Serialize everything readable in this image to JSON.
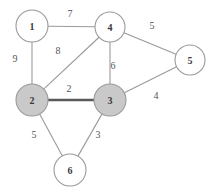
{
  "diagram": {
    "background_color": "#ffffff",
    "edge_color": "#9a9a9a",
    "highlight_edge_color": "#5a5a5a",
    "node_stroke_color": "#9a9a9a",
    "node_fill_default": "#ffffff",
    "node_fill_selected": "#c9c9c9"
  },
  "nodes": [
    {
      "id": "1",
      "label": "1",
      "cx": 32,
      "cy": 26,
      "r": 16,
      "fill": "white"
    },
    {
      "id": "4",
      "label": "4",
      "cx": 110,
      "cy": 27,
      "r": 15,
      "fill": "white"
    },
    {
      "id": "5",
      "label": "5",
      "cx": 190,
      "cy": 60,
      "r": 15,
      "fill": "white"
    },
    {
      "id": "2",
      "label": "2",
      "cx": 32,
      "cy": 100,
      "r": 16,
      "fill": "gray"
    },
    {
      "id": "3",
      "label": "3",
      "cx": 110,
      "cy": 100,
      "r": 16,
      "fill": "gray"
    },
    {
      "id": "6",
      "label": "6",
      "cx": 70,
      "cy": 170,
      "r": 16,
      "fill": "white"
    }
  ],
  "edges": [
    {
      "id": "e-1-4",
      "from": "1",
      "to": "4",
      "weight": "7",
      "lx": 70,
      "ly": 13,
      "highlight": false
    },
    {
      "id": "e-1-2",
      "from": "1",
      "to": "2",
      "weight": "9",
      "lx": 15,
      "ly": 58,
      "highlight": false
    },
    {
      "id": "e-2-4",
      "from": "2",
      "to": "4",
      "weight": "8",
      "lx": 58,
      "ly": 50,
      "highlight": false
    },
    {
      "id": "e-3-4",
      "from": "3",
      "to": "4",
      "weight": "6",
      "lx": 113,
      "ly": 65,
      "highlight": false
    },
    {
      "id": "e-4-5",
      "from": "4",
      "to": "5",
      "weight": "5",
      "lx": 152,
      "ly": 25,
      "highlight": false
    },
    {
      "id": "e-2-3",
      "from": "2",
      "to": "3",
      "weight": "2",
      "lx": 69,
      "ly": 88,
      "highlight": true
    },
    {
      "id": "e-3-5",
      "from": "3",
      "to": "5",
      "weight": "4",
      "lx": 156,
      "ly": 95,
      "highlight": false
    },
    {
      "id": "e-2-6",
      "from": "2",
      "to": "6",
      "weight": "5",
      "lx": 34,
      "ly": 134,
      "highlight": false
    },
    {
      "id": "e-3-6",
      "from": "3",
      "to": "6",
      "weight": "3",
      "lx": 98,
      "ly": 134,
      "highlight": false
    }
  ],
  "chart_data": {
    "type": "diagram",
    "graph_type": "undirected weighted graph",
    "vertices": [
      "1",
      "2",
      "3",
      "4",
      "5",
      "6"
    ],
    "selected_vertices": [
      "2",
      "3"
    ],
    "highlighted_edges": [
      [
        "2",
        "3"
      ]
    ],
    "edge_list": [
      {
        "u": "1",
        "v": "4",
        "w": 7
      },
      {
        "u": "1",
        "v": "2",
        "w": 9
      },
      {
        "u": "2",
        "v": "4",
        "w": 8
      },
      {
        "u": "3",
        "v": "4",
        "w": 6
      },
      {
        "u": "4",
        "v": "5",
        "w": 5
      },
      {
        "u": "2",
        "v": "3",
        "w": 2
      },
      {
        "u": "3",
        "v": "5",
        "w": 4
      },
      {
        "u": "2",
        "v": "6",
        "w": 5
      },
      {
        "u": "3",
        "v": "6",
        "w": 3
      }
    ]
  }
}
